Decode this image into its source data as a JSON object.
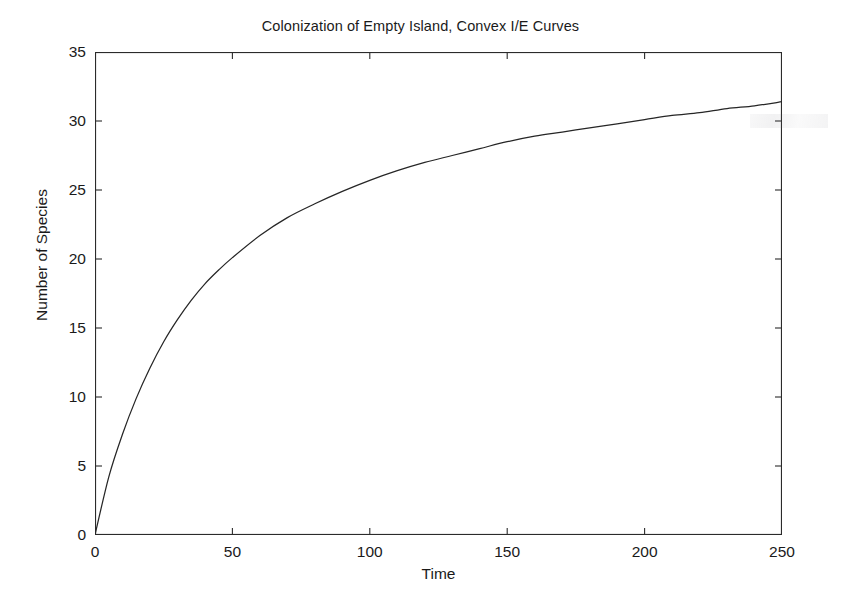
{
  "chart_data": {
    "type": "line",
    "title": "Colonization of Empty Island, Convex I/E Curves",
    "xlabel": "Time",
    "ylabel": "Number of Species",
    "xlim": [
      0,
      250
    ],
    "ylim": [
      0,
      35
    ],
    "xticks": [
      0,
      50,
      100,
      150,
      200,
      250
    ],
    "yticks": [
      0,
      5,
      10,
      15,
      20,
      25,
      30,
      35
    ],
    "xtick_labels": [
      "0",
      "50",
      "100",
      "150",
      "200",
      "250"
    ],
    "ytick_labels": [
      "0",
      "5",
      "10",
      "15",
      "20",
      "25",
      "30",
      "35"
    ],
    "grid": false,
    "legend": null,
    "series": [
      {
        "name": "Species accumulation",
        "color": "#262626",
        "x": [
          0,
          5,
          10,
          15,
          20,
          25,
          30,
          35,
          40,
          45,
          50,
          60,
          70,
          80,
          90,
          100,
          110,
          120,
          130,
          140,
          150,
          160,
          170,
          180,
          190,
          200,
          210,
          220,
          230,
          240,
          250
        ],
        "values": [
          0,
          4.2,
          7.3,
          9.9,
          12.1,
          14.0,
          15.6,
          17.0,
          18.2,
          19.2,
          20.1,
          21.7,
          23.0,
          24.0,
          24.9,
          25.7,
          26.4,
          27.0,
          27.5,
          28.0,
          28.5,
          28.9,
          29.2,
          29.5,
          29.8,
          30.1,
          30.4,
          30.6,
          30.9,
          31.1,
          31.4
        ]
      }
    ]
  },
  "figure": {
    "title": "Colonization of Empty Island, Convex I/E Curves",
    "xlabel": "Time",
    "ylabel": "Number of Species",
    "background_color": "#ffffff",
    "axis_color": "#2b2b2b",
    "curve_color": "#262626"
  }
}
